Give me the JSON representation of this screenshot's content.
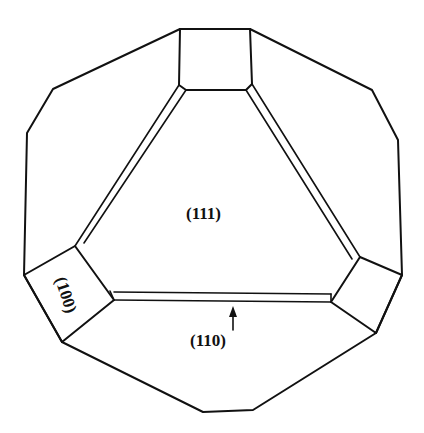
{
  "diagram": {
    "type": "crystal-habit",
    "labels": {
      "face_111": "(111)",
      "face_100": "(100)",
      "face_110": "(110)"
    },
    "colors": {
      "line": "#111111",
      "background": "#ffffff"
    }
  }
}
